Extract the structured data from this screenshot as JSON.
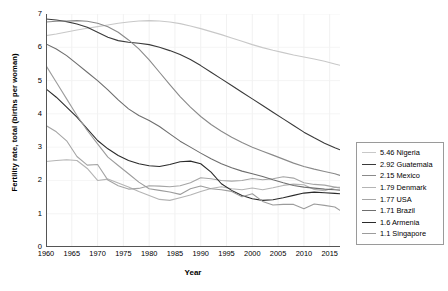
{
  "chart_data": {
    "type": "line",
    "title": "",
    "xlabel": "Year",
    "ylabel": "Fertility rate, total (births per woman)",
    "xlim": [
      1960,
      2017
    ],
    "ylim": [
      0,
      7
    ],
    "grid": true,
    "legend_position": "right-outside",
    "xticks": [
      "1960",
      "1965",
      "1970",
      "1975",
      "1980",
      "1985",
      "1990",
      "1995",
      "2000",
      "2005",
      "2010",
      "2015"
    ],
    "yticks": [
      "0",
      "1",
      "2",
      "3",
      "4",
      "5",
      "6",
      "7"
    ],
    "x": [
      1960,
      1962,
      1964,
      1966,
      1968,
      1970,
      1972,
      1974,
      1976,
      1978,
      1980,
      1982,
      1984,
      1986,
      1988,
      1990,
      1992,
      1994,
      1996,
      1998,
      2000,
      2002,
      2004,
      2006,
      2008,
      2010,
      2012,
      2014,
      2016,
      2017
    ],
    "series": [
      {
        "name": "Nigeria",
        "end_value": 5.46,
        "legend_label": "5.46 Nigeria",
        "color": "#c8c8c8",
        "values": [
          6.35,
          6.4,
          6.46,
          6.52,
          6.57,
          6.62,
          6.67,
          6.72,
          6.76,
          6.79,
          6.8,
          6.79,
          6.76,
          6.71,
          6.64,
          6.56,
          6.47,
          6.38,
          6.28,
          6.18,
          6.08,
          5.99,
          5.91,
          5.84,
          5.77,
          5.71,
          5.65,
          5.58,
          5.5,
          5.46
        ]
      },
      {
        "name": "Guatemala",
        "end_value": 2.92,
        "legend_label": "2.92 Guatemala",
        "color": "#3a3a3a",
        "values": [
          6.85,
          6.82,
          6.77,
          6.7,
          6.6,
          6.45,
          6.3,
          6.2,
          6.15,
          6.12,
          6.08,
          6.0,
          5.9,
          5.78,
          5.63,
          5.45,
          5.25,
          5.05,
          4.85,
          4.65,
          4.45,
          4.25,
          4.05,
          3.85,
          3.65,
          3.45,
          3.28,
          3.12,
          2.98,
          2.92
        ]
      },
      {
        "name": "Mexico",
        "end_value": 2.15,
        "legend_label": "2.15 Mexico",
        "color": "#8a8a8a",
        "values": [
          6.76,
          6.78,
          6.79,
          6.8,
          6.78,
          6.72,
          6.62,
          6.45,
          6.22,
          5.95,
          5.62,
          5.25,
          4.88,
          4.52,
          4.2,
          3.92,
          3.68,
          3.48,
          3.3,
          3.14,
          3.0,
          2.88,
          2.76,
          2.64,
          2.52,
          2.42,
          2.34,
          2.27,
          2.2,
          2.15
        ]
      },
      {
        "name": "Denmark",
        "end_value": 1.79,
        "legend_label": "1.79 Denmark",
        "color": "#b4b4b4",
        "values": [
          2.57,
          2.6,
          2.62,
          2.6,
          2.36,
          2.0,
          2.04,
          1.92,
          1.8,
          1.67,
          1.55,
          1.43,
          1.4,
          1.48,
          1.56,
          1.67,
          1.76,
          1.81,
          1.75,
          1.72,
          1.77,
          1.72,
          1.78,
          1.85,
          1.89,
          1.87,
          1.73,
          1.69,
          1.79,
          1.79
        ]
      },
      {
        "name": "USA",
        "end_value": 1.77,
        "legend_label": "1.77 USA",
        "color": "#a5a5a5",
        "values": [
          3.65,
          3.46,
          3.19,
          2.72,
          2.46,
          2.48,
          2.01,
          1.84,
          1.74,
          1.76,
          1.84,
          1.83,
          1.81,
          1.84,
          1.93,
          2.08,
          2.05,
          2.0,
          1.98,
          2.0,
          2.06,
          2.02,
          2.05,
          2.11,
          2.07,
          1.93,
          1.88,
          1.86,
          1.8,
          1.77
        ]
      },
      {
        "name": "Brazil",
        "end_value": 1.71,
        "legend_label": "1.71 Brazil",
        "color": "#6e6e6e",
        "values": [
          6.1,
          5.95,
          5.75,
          5.5,
          5.25,
          5.0,
          4.72,
          4.42,
          4.15,
          3.95,
          3.8,
          3.62,
          3.4,
          3.18,
          3.0,
          2.82,
          2.65,
          2.5,
          2.38,
          2.28,
          2.2,
          2.12,
          2.02,
          1.93,
          1.85,
          1.8,
          1.77,
          1.74,
          1.72,
          1.71
        ]
      },
      {
        "name": "Armenia",
        "end_value": 1.6,
        "legend_label": "1.6 Armenia",
        "color": "#2b2b2b",
        "values": [
          4.75,
          4.5,
          4.2,
          3.9,
          3.55,
          3.2,
          2.95,
          2.75,
          2.6,
          2.5,
          2.44,
          2.42,
          2.48,
          2.56,
          2.58,
          2.5,
          2.25,
          1.9,
          1.7,
          1.55,
          1.45,
          1.4,
          1.42,
          1.48,
          1.55,
          1.62,
          1.65,
          1.63,
          1.61,
          1.6
        ]
      },
      {
        "name": "Singapore",
        "end_value": 1.1,
        "legend_label": "1.1 Singapore",
        "color": "#9c9c9c",
        "values": [
          5.45,
          4.95,
          4.45,
          3.95,
          3.5,
          3.1,
          2.7,
          2.45,
          2.2,
          1.95,
          1.75,
          1.7,
          1.65,
          1.58,
          1.75,
          1.83,
          1.75,
          1.72,
          1.67,
          1.51,
          1.6,
          1.37,
          1.26,
          1.28,
          1.28,
          1.15,
          1.29,
          1.25,
          1.2,
          1.1
        ]
      }
    ]
  },
  "legend": {
    "items": [
      {
        "label": "5.46 Nigeria"
      },
      {
        "label": "2.92 Guatemala"
      },
      {
        "label": "2.15 Mexico"
      },
      {
        "label": "1.79 Denmark"
      },
      {
        "label": "1.77 USA"
      },
      {
        "label": "1.71 Brazil"
      },
      {
        "label": "1.6 Armenia"
      },
      {
        "label": "1.1 Singapore"
      }
    ]
  }
}
